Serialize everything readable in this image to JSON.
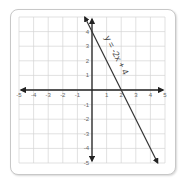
{
  "chart_data": {
    "type": "line",
    "title": "",
    "xlabel": "",
    "ylabel": "",
    "xlim": [
      -5,
      5
    ],
    "ylim": [
      -5,
      5
    ],
    "grid": true,
    "x_ticks": [
      "-5",
      "-4",
      "-3",
      "-2",
      "-1",
      "1",
      "2",
      "3",
      "4",
      "5"
    ],
    "y_ticks": [
      "4",
      "3",
      "2",
      "1",
      "-1",
      "-2",
      "-3",
      "-4",
      "-5"
    ],
    "series": [
      {
        "name": "y = -2x + 4",
        "equation": "y = -2x + 4",
        "slope": -2,
        "intercept": 4,
        "x": [
          -0.5,
          4.5
        ],
        "y": [
          5,
          -5
        ]
      }
    ],
    "annotations": [
      {
        "text": "y = -2x + 4",
        "position": "along line, upper right of y-axis"
      }
    ],
    "legend": "none"
  }
}
